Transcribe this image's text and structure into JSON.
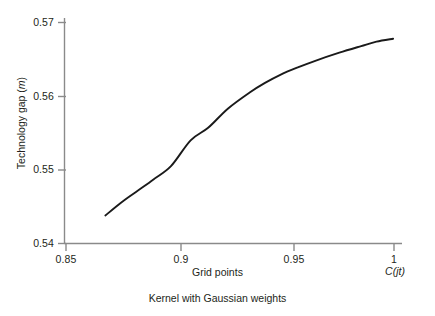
{
  "figure": {
    "caption": "Kernel with Gaussian weights",
    "background_color": "#ffffff",
    "axis_color": "#808080",
    "curve_color": "#1a1a1a"
  },
  "axes": {
    "y_label_prefix": "Technology gap (",
    "y_label_italic": "m",
    "y_label_suffix": ")",
    "x_label": "Grid points",
    "x_end_label_prefix": "C(",
    "x_end_label_italic": "jt",
    "x_end_label_suffix": ")",
    "y_ticks": [
      "0.54",
      "0.55",
      "0.56",
      "0.57"
    ],
    "x_ticks": [
      "0.85",
      "0.9",
      "0.95",
      "1"
    ]
  },
  "chart_data": {
    "type": "line",
    "title": "",
    "subtitle": "",
    "caption": "Kernel with Gaussian weights",
    "xlabel": "Grid points",
    "ylabel": "Technology gap (m)",
    "x_end_annotation": "C(jt)",
    "xlim": [
      0.85,
      1.0
    ],
    "ylim": [
      0.54,
      0.57
    ],
    "xticks": [
      0.85,
      0.9,
      0.95,
      1.0
    ],
    "xticklabels": [
      "0.85",
      "0.9",
      "0.95",
      "1"
    ],
    "yticks": [
      0.54,
      0.55,
      0.56,
      0.57
    ],
    "yticklabels": [
      "0.54",
      "0.55",
      "0.56",
      "0.57"
    ],
    "grid": false,
    "legend": false,
    "series": [
      {
        "name": "technology gap",
        "color": "#1a1a1a",
        "x": [
          0.868,
          0.875,
          0.882,
          0.89,
          0.898,
          0.907,
          0.915,
          0.924,
          0.934,
          0.941,
          0.948,
          0.956,
          0.964,
          0.975,
          0.985,
          0.992,
          0.9996
        ],
        "y": [
          0.5438,
          0.5455,
          0.547,
          0.5487,
          0.5505,
          0.554,
          0.5557,
          0.5583,
          0.5605,
          0.5618,
          0.5629,
          0.5639,
          0.5648,
          0.5659,
          0.5668,
          0.5674,
          0.5678
        ]
      }
    ]
  }
}
